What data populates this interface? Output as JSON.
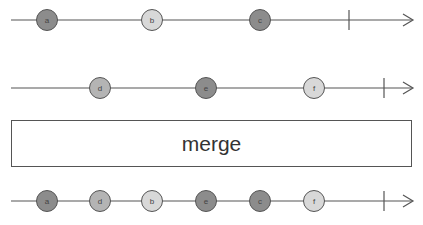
{
  "diagram": {
    "type": "marble-diagram",
    "operator": {
      "label": "merge"
    },
    "colors": {
      "dark": "#8c8c8c",
      "medium": "#b4b4b4",
      "light": "#d8d8d8",
      "stroke": "#555555",
      "line": "#555555"
    },
    "streams": [
      {
        "name": "input-1",
        "y": 20,
        "end_x": 349,
        "marbles": [
          {
            "label": "a",
            "x": 47,
            "shade": "dark"
          },
          {
            "label": "b",
            "x": 152,
            "shade": "light"
          },
          {
            "label": "c",
            "x": 260,
            "shade": "dark"
          }
        ]
      },
      {
        "name": "input-2",
        "y": 88,
        "end_x": 384,
        "marbles": [
          {
            "label": "d",
            "x": 100,
            "shade": "medium"
          },
          {
            "label": "e",
            "x": 206,
            "shade": "dark"
          },
          {
            "label": "f",
            "x": 314,
            "shade": "light"
          }
        ]
      },
      {
        "name": "output",
        "y": 201,
        "end_x": 384,
        "marbles": [
          {
            "label": "a",
            "x": 47,
            "shade": "dark"
          },
          {
            "label": "d",
            "x": 100,
            "shade": "medium"
          },
          {
            "label": "b",
            "x": 152,
            "shade": "light"
          },
          {
            "label": "e",
            "x": 206,
            "shade": "dark"
          },
          {
            "label": "c",
            "x": 260,
            "shade": "dark"
          },
          {
            "label": "f",
            "x": 314,
            "shade": "light"
          }
        ]
      }
    ]
  }
}
